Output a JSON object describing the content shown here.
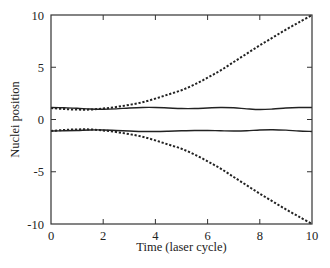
{
  "chart_data": {
    "type": "line",
    "title": "",
    "xlabel": "Time (laser cycle)",
    "ylabel": "Nuclei position",
    "xlim": [
      0,
      10
    ],
    "ylim": [
      -10,
      10
    ],
    "xticks": [
      0,
      2,
      4,
      6,
      8,
      10
    ],
    "yticks": [
      -10,
      -5,
      0,
      5,
      10
    ],
    "xtick_labels": [
      "0",
      "2",
      "4",
      "6",
      "8",
      "10"
    ],
    "ytick_labels": [
      "-10",
      "-5",
      "0",
      "5",
      "10"
    ],
    "grid": false,
    "legend": null,
    "x": [
      0,
      0.5,
      1,
      1.5,
      2,
      2.5,
      3,
      3.5,
      4,
      4.5,
      5,
      5.5,
      6,
      6.5,
      7,
      7.5,
      8,
      8.5,
      9,
      9.5,
      10
    ],
    "series": [
      {
        "name": "upper nucleus (solid)",
        "style": "solid",
        "values": [
          1.15,
          1.12,
          1.08,
          1.0,
          0.98,
          1.02,
          1.1,
          1.15,
          1.15,
          1.1,
          1.05,
          1.05,
          1.1,
          1.15,
          1.12,
          1.02,
          0.95,
          1.0,
          1.1,
          1.15,
          1.15
        ]
      },
      {
        "name": "lower nucleus (solid)",
        "style": "solid",
        "values": [
          -1.1,
          -1.08,
          -1.05,
          -1.0,
          -1.0,
          -1.05,
          -1.1,
          -1.15,
          -1.15,
          -1.12,
          -1.08,
          -1.05,
          -1.05,
          -1.08,
          -1.1,
          -1.08,
          -1.0,
          -0.98,
          -1.02,
          -1.1,
          -1.15
        ]
      },
      {
        "name": "upper nucleus (dashed)",
        "style": "dashed",
        "values": [
          1.1,
          1.0,
          0.95,
          0.95,
          1.05,
          1.2,
          1.4,
          1.65,
          2.0,
          2.4,
          2.8,
          3.35,
          4.0,
          4.7,
          5.5,
          6.3,
          7.1,
          7.85,
          8.6,
          9.3,
          10.0
        ]
      },
      {
        "name": "lower nucleus (dashed)",
        "style": "dashed",
        "values": [
          -1.1,
          -1.0,
          -0.95,
          -0.95,
          -1.05,
          -1.2,
          -1.4,
          -1.65,
          -2.0,
          -2.4,
          -2.8,
          -3.35,
          -4.0,
          -4.7,
          -5.5,
          -6.3,
          -7.1,
          -7.85,
          -8.6,
          -9.3,
          -10.0
        ]
      }
    ]
  }
}
